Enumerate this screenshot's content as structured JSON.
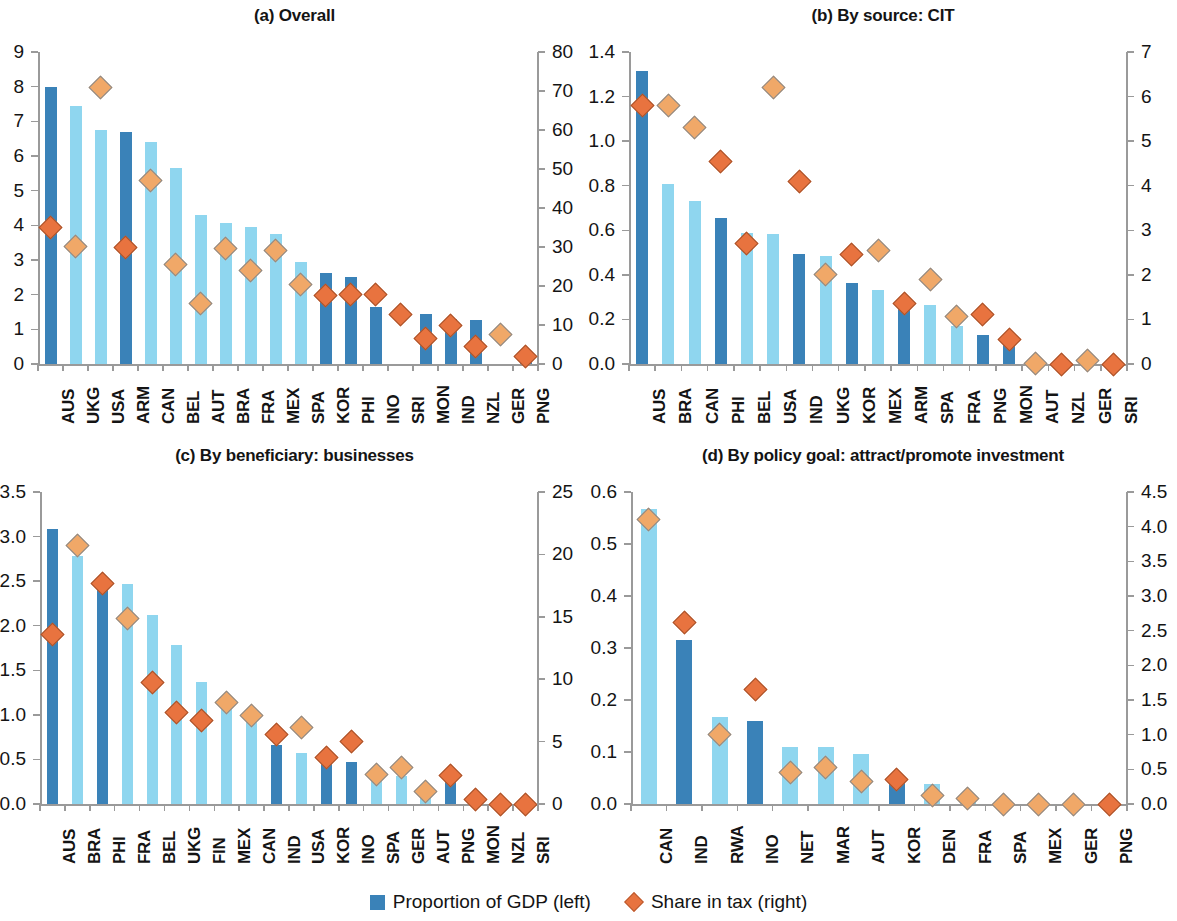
{
  "legend": {
    "bar_label": "Proportion of GDP (left)",
    "diamond_label": "Share in tax (right)",
    "bar_color": "#3a82b8",
    "diamond_color": "#e8733f"
  },
  "colors": {
    "bar_dark": "#3a82b8",
    "bar_light": "#8fd6ef",
    "diamond_strong": "#e8733f",
    "diamond_strong_edge": "#a8542c",
    "diamond_pale": "#f0a868",
    "diamond_pale_edge": "#8a8a8a",
    "axis": "#9a9a9a",
    "text": "#141414"
  },
  "chart_data": [
    {
      "type": "bar",
      "panel": "a",
      "title": "(a) Overall",
      "xlabel": "",
      "ylabel": "",
      "ylim": [
        0,
        9
      ],
      "yticks": [
        0,
        1,
        2,
        3,
        4,
        5,
        6,
        7,
        8,
        9
      ],
      "ytick_labels": [
        "0",
        "1",
        "2",
        "3",
        "4",
        "5",
        "6",
        "7",
        "8",
        "9"
      ],
      "y2lim": [
        0,
        80
      ],
      "y2ticks": [
        0,
        10,
        20,
        30,
        40,
        50,
        60,
        70,
        80
      ],
      "y2tick_labels": [
        "0",
        "10",
        "20",
        "30",
        "40",
        "50",
        "60",
        "70",
        "80"
      ],
      "grid": false,
      "legend_position": "figure-bottom-center",
      "categories": [
        "AUS",
        "UKG",
        "USA",
        "ARM",
        "CAN",
        "BEL",
        "AUT",
        "BRA",
        "FRA",
        "MEX",
        "SPA",
        "KOR",
        "PHI",
        "INO",
        "SRI",
        "MON",
        "IND",
        "NZL",
        "GER",
        "PNG"
      ],
      "series": [
        {
          "name": "Proportion of GDP (left)",
          "axis": "left",
          "values": [
            8.0,
            7.45,
            6.75,
            6.7,
            6.4,
            5.65,
            4.3,
            4.08,
            3.95,
            3.75,
            2.95,
            2.62,
            2.52,
            1.65,
            0.0,
            1.45,
            1.3,
            1.27,
            0.0,
            0.05
          ],
          "shades": [
            "dark",
            "light",
            "light",
            "dark",
            "light",
            "light",
            "light",
            "light",
            "light",
            "light",
            "light",
            "dark",
            "dark",
            "dark",
            "dark",
            "dark",
            "dark",
            "dark",
            "light",
            "dark"
          ]
        },
        {
          "name": "Share in tax (right)",
          "axis": "right",
          "values": [
            35.0,
            30.2,
            71.0,
            30.0,
            47.0,
            25.5,
            15.5,
            29.5,
            24.0,
            29.0,
            20.5,
            17.5,
            17.8,
            17.8,
            12.8,
            6.5,
            10.0,
            4.5,
            7.5,
            2.0
          ],
          "tones": [
            "strong",
            "pale",
            "pale",
            "strong",
            "pale",
            "pale",
            "pale",
            "pale",
            "pale",
            "pale",
            "pale",
            "strong",
            "strong",
            "strong",
            "strong",
            "strong",
            "strong",
            "strong",
            "pale",
            "strong"
          ]
        }
      ]
    },
    {
      "type": "bar",
      "panel": "b",
      "title": "(b) By source: CIT",
      "xlabel": "",
      "ylabel": "",
      "ylim": [
        0,
        1.4
      ],
      "yticks": [
        0,
        0.2,
        0.4,
        0.6,
        0.8,
        1.0,
        1.2,
        1.4
      ],
      "ytick_labels": [
        "0.0",
        "0.2",
        "0.4",
        "0.6",
        "0.8",
        "1.0",
        "1.2",
        "1.4"
      ],
      "y2lim": [
        0,
        7
      ],
      "y2ticks": [
        0,
        1,
        2,
        3,
        4,
        5,
        6,
        7
      ],
      "y2tick_labels": [
        "0",
        "1",
        "2",
        "3",
        "4",
        "5",
        "6",
        "7"
      ],
      "grid": false,
      "legend_position": "figure-bottom-center",
      "categories": [
        "AUS",
        "BRA",
        "CAN",
        "PHI",
        "BEL",
        "USA",
        "IND",
        "UKG",
        "KOR",
        "MEX",
        "ARM",
        "SPA",
        "FRA",
        "PNG",
        "MON",
        "AUT",
        "NZL",
        "GER",
        "SRI"
      ],
      "series": [
        {
          "name": "Proportion of GDP (left)",
          "axis": "left",
          "values": [
            1.315,
            0.81,
            0.73,
            0.655,
            0.59,
            0.585,
            0.495,
            0.485,
            0.365,
            0.33,
            0.265,
            0.265,
            0.17,
            0.13,
            0.105,
            0.0,
            0.0,
            0.0,
            0.0
          ],
          "shades": [
            "dark",
            "light",
            "light",
            "dark",
            "light",
            "light",
            "dark",
            "light",
            "dark",
            "light",
            "dark",
            "light",
            "light",
            "dark",
            "dark",
            "light",
            "light",
            "light",
            "light"
          ]
        },
        {
          "name": "Share in tax (right)",
          "axis": "right",
          "values": [
            5.8,
            5.8,
            5.3,
            4.55,
            2.7,
            6.2,
            4.1,
            2.0,
            2.45,
            2.55,
            1.35,
            1.9,
            1.07,
            1.12,
            0.55,
            0.02,
            0.0,
            0.08,
            0.0
          ],
          "tones": [
            "strong",
            "pale",
            "pale",
            "strong",
            "strong",
            "pale",
            "strong",
            "pale",
            "strong",
            "pale",
            "strong",
            "pale",
            "pale",
            "strong",
            "strong",
            "pale",
            "strong",
            "pale",
            "strong"
          ]
        }
      ]
    },
    {
      "type": "bar",
      "panel": "c",
      "title": "(c) By beneficiary: businesses",
      "xlabel": "",
      "ylabel": "",
      "ylim": [
        0,
        3.5
      ],
      "yticks": [
        0,
        0.5,
        1.0,
        1.5,
        2.0,
        2.5,
        3.0,
        3.5
      ],
      "ytick_labels": [
        "0.0",
        "0.5",
        "1.0",
        "1.5",
        "2.0",
        "2.5",
        "3.0",
        "3.5"
      ],
      "y2lim": [
        0,
        25
      ],
      "y2ticks": [
        0,
        5,
        10,
        15,
        20,
        25
      ],
      "y2tick_labels": [
        "0",
        "5",
        "10",
        "15",
        "20",
        "25"
      ],
      "grid": false,
      "legend_position": "figure-bottom-center",
      "categories": [
        "AUS",
        "BRA",
        "PHI",
        "FRA",
        "BEL",
        "UKG",
        "FIN",
        "MEX",
        "CAN",
        "IND",
        "USA",
        "KOR",
        "INO",
        "SPA",
        "GER",
        "AUT",
        "PNG",
        "MON",
        "NZL",
        "SRI"
      ],
      "series": [
        {
          "name": "Proportion of GDP (left)",
          "axis": "left",
          "values": [
            3.08,
            2.78,
            2.46,
            2.47,
            2.12,
            1.78,
            1.37,
            1.13,
            0.97,
            0.66,
            0.57,
            0.5,
            0.47,
            0.33,
            0.31,
            0.13,
            0.27,
            0.0,
            0.0,
            0.0
          ],
          "shades": [
            "dark",
            "light",
            "dark",
            "light",
            "light",
            "light",
            "light",
            "light",
            "light",
            "dark",
            "light",
            "dark",
            "dark",
            "light",
            "light",
            "light",
            "dark",
            "light",
            "light",
            "light"
          ]
        },
        {
          "name": "Share in tax (right)",
          "axis": "right",
          "values": [
            13.6,
            20.7,
            17.7,
            14.9,
            9.7,
            7.3,
            6.7,
            8.1,
            7.1,
            5.6,
            6.1,
            3.7,
            5.0,
            2.4,
            2.9,
            1.0,
            2.3,
            0.4,
            0.0,
            0.0
          ],
          "tones": [
            "strong",
            "pale",
            "strong",
            "pale",
            "strong",
            "strong",
            "strong",
            "pale",
            "pale",
            "strong",
            "pale",
            "strong",
            "strong",
            "pale",
            "pale",
            "pale",
            "strong",
            "strong",
            "strong",
            "strong"
          ]
        }
      ]
    },
    {
      "type": "bar",
      "panel": "d",
      "title": "(d) By policy goal: attract/promote investment",
      "xlabel": "",
      "ylabel": "",
      "ylim": [
        0,
        0.6
      ],
      "yticks": [
        0,
        0.1,
        0.2,
        0.3,
        0.4,
        0.5,
        0.6
      ],
      "ytick_labels": [
        "0.0",
        "0.1",
        "0.2",
        "0.3",
        "0.4",
        "0.5",
        "0.6"
      ],
      "y2lim": [
        0,
        4.5
      ],
      "y2ticks": [
        0,
        0.5,
        1.0,
        1.5,
        2.0,
        2.5,
        3.0,
        3.5,
        4.0,
        4.5
      ],
      "y2tick_labels": [
        "0.0",
        "0.5",
        "1.0",
        "1.5",
        "2.0",
        "2.5",
        "3.0",
        "3.5",
        "4.0",
        "4.5"
      ],
      "grid": false,
      "legend_position": "figure-bottom-center",
      "categories": [
        "CAN",
        "IND",
        "RWA",
        "INO",
        "NET",
        "MAR",
        "AUT",
        "KOR",
        "DEN",
        "FRA",
        "SPA",
        "MEX",
        "GER",
        "PNG"
      ],
      "series": [
        {
          "name": "Proportion of GDP (left)",
          "axis": "left",
          "values": [
            0.567,
            0.315,
            0.168,
            0.16,
            0.11,
            0.11,
            0.097,
            0.046,
            0.038,
            0.008,
            0.0,
            0.0,
            0.0,
            0.0
          ],
          "shades": [
            "light",
            "dark",
            "light",
            "dark",
            "light",
            "light",
            "light",
            "dark",
            "light",
            "light",
            "light",
            "light",
            "light",
            "light"
          ]
        },
        {
          "name": "Share in tax (right)",
          "axis": "right",
          "values": [
            4.1,
            2.62,
            1.0,
            1.65,
            0.45,
            0.52,
            0.33,
            0.35,
            0.12,
            0.08,
            0.0,
            0.0,
            0.0,
            0.0
          ],
          "tones": [
            "pale",
            "strong",
            "pale",
            "strong",
            "pale",
            "pale",
            "pale",
            "strong",
            "pale",
            "pale",
            "pale",
            "pale",
            "pale",
            "strong"
          ]
        }
      ]
    }
  ]
}
